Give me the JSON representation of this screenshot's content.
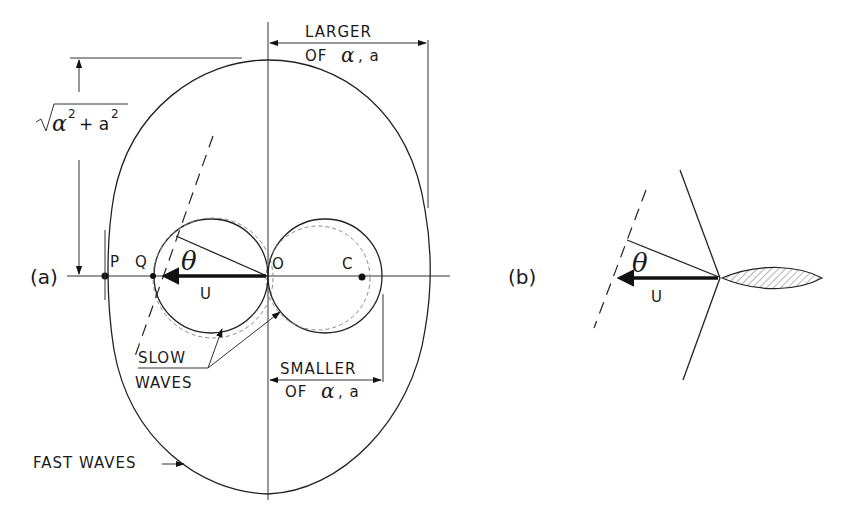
{
  "figure": {
    "panel_a": {
      "label": "(a)",
      "points": {
        "P": "P",
        "Q": "Q",
        "O": "O",
        "C": "C"
      },
      "angle_label": "θ",
      "vector_label": "U",
      "dimension_top": {
        "line1": "LARGER",
        "line2_prefix": "OF",
        "line2_greek": "α",
        "line2_suffix": ", a"
      },
      "dimension_bottom": {
        "line1": "SMALLER",
        "line2_prefix": "OF",
        "line2_greek": "α",
        "line2_suffix": ", a"
      },
      "radius_label": {
        "sqrt": "√",
        "alpha": "α",
        "sup1": "2",
        "plus": "+ a",
        "sup2": "2"
      },
      "slow_waves": {
        "line1": "SLOW",
        "line2": "WAVES"
      },
      "fast_waves": "FAST WAVES"
    },
    "panel_b": {
      "label": "(b)",
      "angle_label": "θ",
      "vector_label": "U"
    }
  }
}
